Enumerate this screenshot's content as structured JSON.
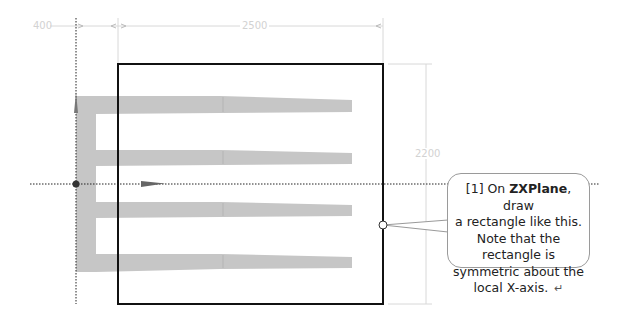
{
  "dimensions": {
    "left_offset": "400",
    "width": "2500",
    "height": "2200"
  },
  "callout": {
    "step": "[1] On ",
    "plane": "ZXPlane",
    "text_after_plane": ", draw",
    "line2": "a rectangle like this.",
    "line3": "Note that the rectangle is",
    "line4": "symmetric about the",
    "line5": "local X-axis.",
    "enter_icon": "↵"
  },
  "colors": {
    "rectangle": "#111111",
    "comb_shape": "#c4c4c4",
    "dimension_lines": "#d8d8d8",
    "axis_dotted": "#222222"
  }
}
